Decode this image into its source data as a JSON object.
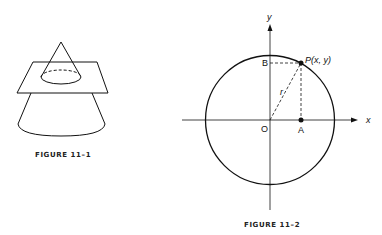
{
  "figures": [
    {
      "id": "figure-11-1",
      "caption": "FIGURE 11–1",
      "description": "Cone intersected by a horizontal plane, cross-section ellipse shown with dashed hidden back edge"
    },
    {
      "id": "figure-11-2",
      "caption": "FIGURE 11–2",
      "description": "Circle centered at origin with point P on circle and projections to axes",
      "labels": {
        "y_axis": "y",
        "x_axis": "x",
        "origin": "O",
        "point_p": "P(x, y)",
        "point_a": "A",
        "point_b": "B",
        "radius": "r"
      }
    }
  ],
  "colors": {
    "ink": "#111111",
    "background": "#ffffff"
  }
}
